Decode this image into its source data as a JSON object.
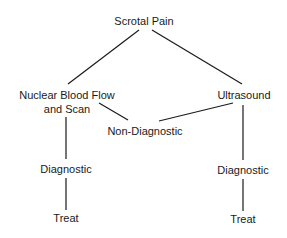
{
  "diagram": {
    "type": "flowchart",
    "nodes": {
      "root": "Scrotal Pain",
      "nuclear_line1": "Nuclear Blood Flow",
      "nuclear_line2": "and Scan",
      "ultrasound": "Ultrasound",
      "non_diagnostic": "Non-Diagnostic",
      "left_diagnostic": "Diagnostic",
      "left_treat": "Treat",
      "right_diagnostic": "Diagnostic",
      "right_treat": "Treat"
    },
    "edges": [
      [
        "Scrotal Pain",
        "Nuclear Blood Flow and Scan"
      ],
      [
        "Scrotal Pain",
        "Ultrasound"
      ],
      [
        "Nuclear Blood Flow and Scan",
        "Non-Diagnostic"
      ],
      [
        "Ultrasound",
        "Non-Diagnostic"
      ],
      [
        "Nuclear Blood Flow and Scan",
        "Diagnostic"
      ],
      [
        "Diagnostic",
        "Treat"
      ],
      [
        "Ultrasound",
        "Diagnostic"
      ],
      [
        "Diagnostic",
        "Treat"
      ]
    ],
    "colors": {
      "line": "#1a1a1a",
      "text": "#1a1a1a",
      "background": "#ffffff"
    }
  }
}
